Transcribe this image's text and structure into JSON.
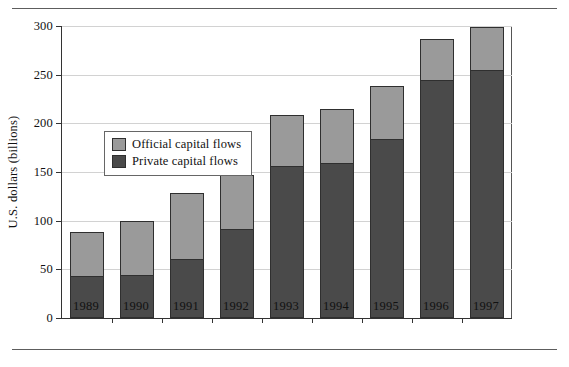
{
  "chart_data": {
    "type": "bar",
    "subtype": "stacked-vertical",
    "title": "",
    "xlabel": "",
    "ylabel": "U.S. dollars (billions)",
    "categories": [
      "1989",
      "1990",
      "1991",
      "1992",
      "1993",
      "1994",
      "1995",
      "1996",
      "1997"
    ],
    "series": [
      {
        "name": "Private capital flows",
        "color": "#4a4a4a",
        "values": [
          43,
          44,
          61,
          92,
          157,
          160,
          184,
          245,
          256
        ]
      },
      {
        "name": "Official capital flows",
        "color": "#9a9a9a",
        "values": [
          45,
          56,
          67,
          55,
          52,
          55,
          54,
          42,
          43
        ]
      }
    ],
    "totals": [
      88,
      100,
      128,
      147,
      209,
      215,
      238,
      287,
      299
    ],
    "ylim": [
      0,
      300
    ],
    "yticks": [
      0,
      50,
      100,
      150,
      200,
      250,
      300
    ],
    "ytick_labels": [
      "0",
      "50",
      "100",
      "150",
      "200",
      "250",
      "300"
    ],
    "grid": true,
    "grid_axis": "y",
    "legend": {
      "position": "upper-left-inside",
      "entries": [
        {
          "label": "Official capital flows",
          "color": "#9a9a9a"
        },
        {
          "label": "Private capital flows",
          "color": "#4a4a4a"
        }
      ]
    },
    "stack_order": [
      "Private capital flows",
      "Official capital flows"
    ]
  },
  "colors": {
    "official": "#9a9a9a",
    "private": "#4a4a4a",
    "axis": "#333333",
    "grid": "#d2d2d2",
    "rule": "#5d5d5d",
    "background": "#ffffff"
  }
}
